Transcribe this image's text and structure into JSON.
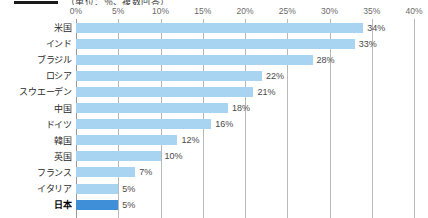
{
  "legend": {
    "text": "（単位：％、複数回答）"
  },
  "chart_data": {
    "type": "bar",
    "orientation": "horizontal",
    "title": "",
    "subtitle": "",
    "xlabel": "",
    "ylabel": "",
    "xlim": [
      0,
      40
    ],
    "xtick_labels": [
      "0%",
      "5%",
      "10%",
      "15%",
      "20%",
      "25%",
      "30%",
      "35%",
      "40%"
    ],
    "xticks": [
      0,
      5,
      10,
      15,
      20,
      25,
      30,
      35,
      40
    ],
    "grid": true,
    "legend_position": "none",
    "categories": [
      "米国",
      "インド",
      "ブラジル",
      "ロシア",
      "スウエーデン",
      "中国",
      "ドイツ",
      "韓国",
      "英国",
      "フランス",
      "イタリア",
      "日本"
    ],
    "values": [
      34,
      33,
      28,
      22,
      21,
      18,
      16,
      12,
      10,
      7,
      5,
      5
    ],
    "value_labels": [
      "34%",
      "33%",
      "28%",
      "22%",
      "21%",
      "18%",
      "16%",
      "12%",
      "10%",
      "7%",
      "5%",
      "5%"
    ],
    "highlight_index": 11,
    "colors": {
      "bar": "#a8d4f2",
      "bar_highlight": "#3f8fd8",
      "gridline": "#b9b9b9",
      "axis_text": "#6a6a6a",
      "category_text": "#2b2b2b",
      "value_text": "#4a4a4a"
    }
  }
}
